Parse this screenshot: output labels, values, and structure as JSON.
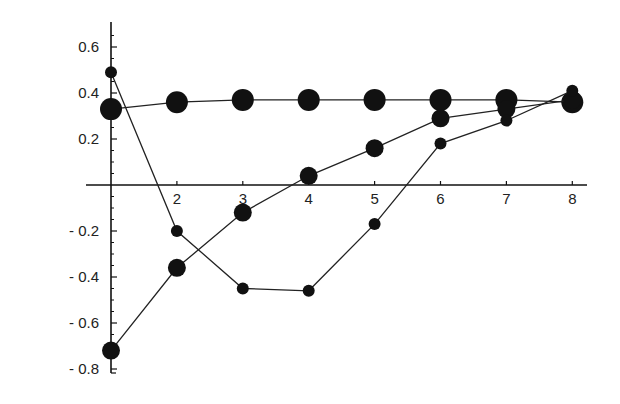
{
  "chart_data": {
    "type": "line",
    "title": "",
    "xlabel": "",
    "ylabel": "",
    "x": [
      1,
      2,
      3,
      4,
      5,
      6,
      7,
      8
    ],
    "xticks": [
      2,
      3,
      4,
      5,
      6,
      7,
      8
    ],
    "xtick_labels": [
      "2",
      "3",
      "4",
      "5",
      "6",
      "7",
      "8"
    ],
    "yticks": [
      0.6,
      0.4,
      0.2,
      -0.2,
      -0.4,
      -0.6,
      -0.8
    ],
    "ytick_labels": [
      "0.6",
      "0.4",
      "0.2",
      "- 0.2",
      "- 0.4",
      "- 0.6",
      "- 0.8"
    ],
    "xlim": [
      1,
      8.2
    ],
    "ylim": [
      -0.82,
      0.7
    ],
    "grid": false,
    "legend": null,
    "series": [
      {
        "name": "large markers",
        "marker_size": 11,
        "values": [
          0.33,
          0.36,
          0.37,
          0.37,
          0.37,
          0.37,
          0.37,
          0.36
        ]
      },
      {
        "name": "medium markers",
        "marker_size": 9,
        "values": [
          -0.72,
          -0.36,
          -0.12,
          0.04,
          0.16,
          0.29,
          0.33,
          0.37
        ]
      },
      {
        "name": "small markers",
        "marker_size": 6,
        "values": [
          0.49,
          -0.2,
          -0.45,
          -0.46,
          -0.17,
          0.18,
          0.28,
          0.41
        ]
      }
    ]
  }
}
